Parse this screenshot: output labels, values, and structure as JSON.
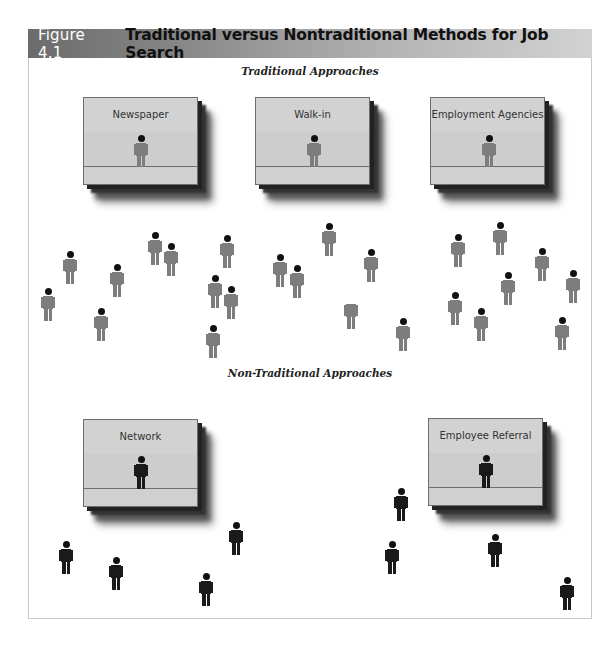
{
  "figure": {
    "number": "Figure 4.1",
    "title": "Traditional versus Nontraditional Methods for Job Search"
  },
  "sections": {
    "traditional": {
      "heading": "Traditional Approaches",
      "boxes": [
        {
          "label": "Newspaper",
          "x": 83,
          "y": 97
        },
        {
          "label": "Walk-in",
          "x": 255,
          "y": 97
        },
        {
          "label": "Employment Agencies",
          "x": 430,
          "y": 97
        }
      ],
      "scattered_people": [
        {
          "x": 48,
          "y": 288
        },
        {
          "x": 70,
          "y": 251
        },
        {
          "x": 117,
          "y": 264
        },
        {
          "x": 101,
          "y": 308
        },
        {
          "x": 155,
          "y": 232
        },
        {
          "x": 171,
          "y": 243
        },
        {
          "x": 227,
          "y": 235
        },
        {
          "x": 215,
          "y": 275
        },
        {
          "x": 231,
          "y": 286
        },
        {
          "x": 213,
          "y": 325
        },
        {
          "x": 329,
          "y": 223
        },
        {
          "x": 280,
          "y": 254
        },
        {
          "x": 297,
          "y": 265
        },
        {
          "x": 371,
          "y": 249
        },
        {
          "x": 351,
          "y": 296,
          "headless": true
        },
        {
          "x": 403,
          "y": 318
        },
        {
          "x": 458,
          "y": 234
        },
        {
          "x": 500,
          "y": 222
        },
        {
          "x": 542,
          "y": 248
        },
        {
          "x": 508,
          "y": 272
        },
        {
          "x": 573,
          "y": 270
        },
        {
          "x": 455,
          "y": 292
        },
        {
          "x": 481,
          "y": 308
        },
        {
          "x": 562,
          "y": 317
        }
      ]
    },
    "nontraditional": {
      "heading": "Non-Traditional Approaches",
      "boxes": [
        {
          "label": "Network",
          "x": 83,
          "y": 419
        },
        {
          "label": "Employee Referral",
          "x": 428,
          "y": 418
        }
      ],
      "scattered_people": [
        {
          "x": 66,
          "y": 541
        },
        {
          "x": 116,
          "y": 557
        },
        {
          "x": 236,
          "y": 522
        },
        {
          "x": 206,
          "y": 573
        },
        {
          "x": 401,
          "y": 488
        },
        {
          "x": 392,
          "y": 541
        },
        {
          "x": 495,
          "y": 534
        },
        {
          "x": 567,
          "y": 577
        }
      ]
    }
  },
  "colors": {
    "traditional_person": "#7d7d7d",
    "nontraditional_person": "#1a1a1a",
    "box_fill": "#d0d0d0",
    "title_gradient_start": "#6b6b6b",
    "title_gradient_end": "#d2d2d2"
  }
}
